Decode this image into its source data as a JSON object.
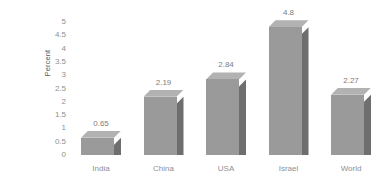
{
  "chart_data": {
    "type": "bar",
    "title": "",
    "subtitle": "",
    "xlabel": "",
    "ylabel": "Percent",
    "categories": [
      "India",
      "China",
      "USA",
      "Israel",
      "World"
    ],
    "values": [
      0.65,
      2.19,
      2.84,
      4.8,
      2.27
    ],
    "value_labels": [
      "0.65",
      "2.19",
      "2.84",
      "4.8",
      "2.27"
    ],
    "series": [
      {
        "name": "Percent",
        "values": [
          0.65,
          2.19,
          2.84,
          4.8,
          2.27
        ]
      }
    ],
    "ylim": [
      0,
      5
    ],
    "ytick_values": [
      0,
      0.5,
      1,
      1.5,
      2,
      2.5,
      3,
      3.5,
      4,
      4.5,
      5
    ],
    "ytick_labels": [
      "0",
      "0.5",
      "1",
      "1.5",
      "2",
      "2.5",
      "3",
      "3.5",
      "4",
      "4.5",
      "5"
    ],
    "grid": false,
    "legend": false,
    "legend_position": "none",
    "style": "3d-bar",
    "colors": {
      "bar_front": "#9a9a9a",
      "bar_side": "#6e6e6e",
      "bar_top": "#b2b2b2",
      "tick_text": "#8f8f8f",
      "value_text": "#7d7d7d",
      "axis_title": "#555555",
      "background": "#ffffff"
    }
  }
}
